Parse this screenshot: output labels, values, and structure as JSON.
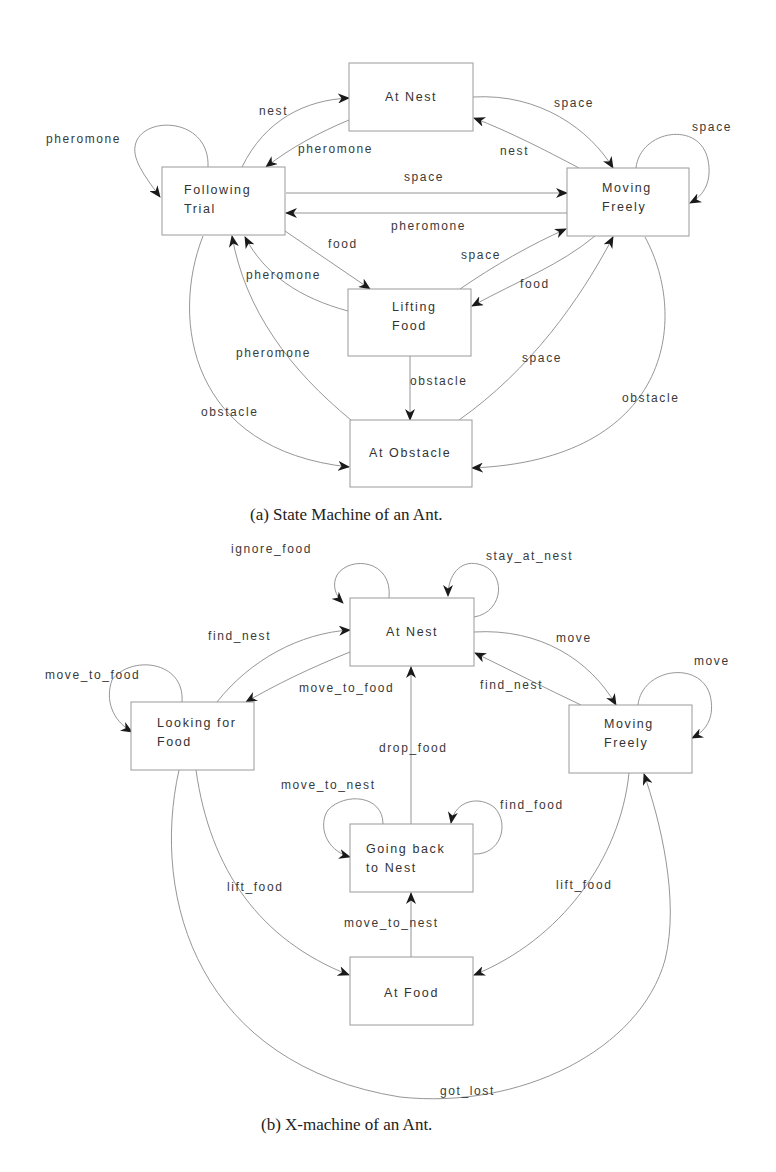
{
  "diagram_a": {
    "caption": "(a) State Machine of an Ant.",
    "states": {
      "at_nest": "At Nest",
      "following_trial": [
        "Following",
        "Trial"
      ],
      "moving_freely": [
        "Moving",
        "Freely"
      ],
      "lifting_food": [
        "Lifting",
        "Food"
      ],
      "at_obstacle": "At Obstacle"
    },
    "transitions": [
      {
        "from": "Following Trial",
        "to": "Following Trial",
        "label": "pheromone"
      },
      {
        "from": "Following Trial",
        "to": "At Nest",
        "label": "nest"
      },
      {
        "from": "At Nest",
        "to": "Following Trial",
        "label": "pheromone"
      },
      {
        "from": "At Nest",
        "to": "Moving Freely",
        "label": "space"
      },
      {
        "from": "Moving Freely",
        "to": "At Nest",
        "label": "nest"
      },
      {
        "from": "Moving Freely",
        "to": "Moving Freely",
        "label": "space"
      },
      {
        "from": "Following Trial",
        "to": "Moving Freely",
        "label": "space"
      },
      {
        "from": "Moving Freely",
        "to": "Following Trial",
        "label": "pheromone"
      },
      {
        "from": "Following Trial",
        "to": "Lifting Food",
        "label": "food"
      },
      {
        "from": "Lifting Food",
        "to": "Following Trial",
        "label": "pheromone"
      },
      {
        "from": "Lifting Food",
        "to": "Moving Freely",
        "label": "space"
      },
      {
        "from": "Moving Freely",
        "to": "Lifting Food",
        "label": "food"
      },
      {
        "from": "At Obstacle",
        "to": "Following Trial",
        "label": "pheromone"
      },
      {
        "from": "Lifting Food",
        "to": "At Obstacle",
        "label": "obstacle"
      },
      {
        "from": "At Obstacle",
        "to": "Moving Freely",
        "label": "space"
      },
      {
        "from": "Following Trial",
        "to": "At Obstacle",
        "label": "obstacle"
      },
      {
        "from": "Moving Freely",
        "to": "At Obstacle",
        "label": "obstacle"
      }
    ]
  },
  "diagram_b": {
    "caption": "(b) X-machine of an Ant.",
    "states": {
      "at_nest": "At Nest",
      "looking_for_food": [
        "Looking for",
        "Food"
      ],
      "moving_freely": [
        "Moving",
        "Freely"
      ],
      "going_back": [
        "Going back",
        "to Nest"
      ],
      "at_food": "At Food"
    },
    "transitions": [
      {
        "from": "At Nest",
        "to": "At Nest",
        "label": "ignore_food"
      },
      {
        "from": "At Nest",
        "to": "At Nest",
        "label": "stay_at_nest"
      },
      {
        "from": "Looking for Food",
        "to": "At Nest",
        "label": "find_nest"
      },
      {
        "from": "At Nest",
        "to": "Looking for Food",
        "label": "move_to_food"
      },
      {
        "from": "Looking for Food",
        "to": "Looking for Food",
        "label": "move_to_food"
      },
      {
        "from": "At Nest",
        "to": "Moving Freely",
        "label": "move"
      },
      {
        "from": "Moving Freely",
        "to": "At Nest",
        "label": "find_nest"
      },
      {
        "from": "Moving Freely",
        "to": "Moving Freely",
        "label": "move"
      },
      {
        "from": "Going back to Nest",
        "to": "At Nest",
        "label": "drop_food"
      },
      {
        "from": "Going back to Nest",
        "to": "Going back to Nest",
        "label": "move_to_nest"
      },
      {
        "from": "Going back to Nest",
        "to": "Going back to Nest",
        "label": "find_food"
      },
      {
        "from": "Looking for Food",
        "to": "At Food",
        "label": "lift_food"
      },
      {
        "from": "Moving Freely",
        "to": "At Food",
        "label": "lift_food"
      },
      {
        "from": "At Food",
        "to": "Going back to Nest",
        "label": "move_to_nest"
      },
      {
        "from": "Looking for Food",
        "to": "Moving Freely",
        "label": "got_lost"
      }
    ]
  }
}
